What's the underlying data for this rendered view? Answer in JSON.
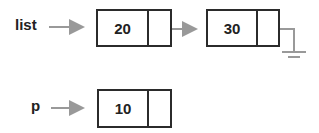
{
  "diagram": {
    "type": "linked-list",
    "pointers": [
      {
        "name": "list",
        "points_to": "node-20"
      },
      {
        "name": "p",
        "points_to": "node-10"
      }
    ],
    "nodes": [
      {
        "id": "node-20",
        "value": "20",
        "next": "node-30"
      },
      {
        "id": "node-30",
        "value": "30",
        "next": "null (ground)"
      },
      {
        "id": "node-10",
        "value": "10",
        "next": "empty"
      }
    ],
    "colors": {
      "box": "#2b2b2b",
      "arrow": "#999999",
      "text": "#222222"
    }
  }
}
